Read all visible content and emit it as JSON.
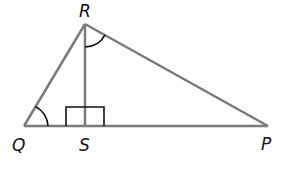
{
  "diagram": {
    "type": "geometry-triangle",
    "vertices": {
      "R": {
        "label": "R",
        "x": 85,
        "y": 24
      },
      "Q": {
        "label": "Q",
        "x": 24,
        "y": 126
      },
      "S": {
        "label": "S",
        "x": 85,
        "y": 126
      },
      "P": {
        "label": "P",
        "x": 268,
        "y": 126
      }
    },
    "segments": [
      "QR",
      "RP",
      "QP",
      "RS"
    ],
    "marks": {
      "right_angles": [
        "RSQ",
        "RSP"
      ],
      "equal_angles": [
        "RQS",
        "SRP"
      ]
    },
    "colors": {
      "line": "#7a7a7a",
      "mark": "#111111",
      "label": "#111111"
    }
  }
}
